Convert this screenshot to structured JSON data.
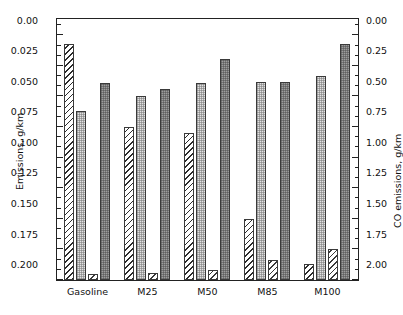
{
  "chart_data": {
    "type": "bar",
    "title": "",
    "subtitle": "",
    "categories": [
      "Gasoline",
      "M25",
      "M50",
      "M85",
      "M100"
    ],
    "xlabel": "",
    "ylabel": "Emissions, g/km",
    "ylabel_right": "CO emissions, g/km",
    "ylim": [
      0,
      0.2125
    ],
    "ylim_right": [
      0,
      2.125
    ],
    "ytick_labels_left": [
      "0.00",
      "0.025",
      "0.050",
      "0.075",
      "0.100",
      "0.125",
      "0.150",
      "0.175",
      "0.200"
    ],
    "ytick_values_left": [
      0,
      0.025,
      0.05,
      0.075,
      0.1,
      0.125,
      0.15,
      0.175,
      0.2
    ],
    "ytick_labels_right": [
      "0.00",
      "0.25",
      "0.50",
      "0.75",
      "1.00",
      "1.25",
      "1.50",
      "1.75",
      "2.00"
    ],
    "ytick_values_right": [
      0,
      0.25,
      0.5,
      0.75,
      1.0,
      1.25,
      1.5,
      1.75,
      2.0
    ],
    "minor_ticks_per_major": 2,
    "grid": false,
    "legend": null,
    "legend_position": "none",
    "series": [
      {
        "name": "series-1-hatched",
        "axis": "left",
        "pattern": "diagonal-hatch",
        "values": [
          0.193,
          0.125,
          0.12,
          0.05,
          0.013
        ]
      },
      {
        "name": "series-2-light",
        "axis": "left",
        "pattern": "light-stipple",
        "values": [
          0.138,
          0.15,
          0.161,
          0.162,
          0.167
        ]
      },
      {
        "name": "series-3-crosshatch",
        "axis": "left",
        "pattern": "fine-hatch",
        "values": [
          0.005,
          0.006,
          0.008,
          0.016,
          0.025
        ]
      },
      {
        "name": "series-4-dark",
        "axis": "right",
        "pattern": "dark-stipple",
        "values": [
          1.61,
          1.56,
          1.81,
          1.62,
          1.93
        ]
      }
    ]
  },
  "colors": {
    "axis": "#222222",
    "series_1": "#ffffff",
    "series_2": "#e2e2e2",
    "series_3": "#ffffff",
    "series_4": "#9d9d9d",
    "background": "#ffffff"
  }
}
